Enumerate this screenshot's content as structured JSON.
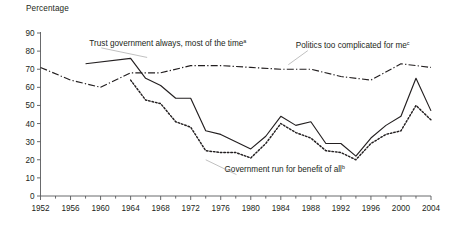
{
  "chart_data": {
    "type": "line",
    "title": "",
    "ylabel": "Percentage",
    "xlabel": "",
    "ylim": [
      0,
      90
    ],
    "xlim": [
      1952,
      2004
    ],
    "ytick_step": 10,
    "xtick_step": 4,
    "minor_xtick_step": 2,
    "grid": false,
    "legend": "inline-annotations",
    "yticks": [
      "0",
      "10",
      "20",
      "30",
      "40",
      "50",
      "60",
      "70",
      "80",
      "90"
    ],
    "xticks": [
      "1952",
      "1956",
      "1960",
      "1964",
      "1968",
      "1972",
      "1976",
      "1980",
      "1984",
      "1988",
      "1992",
      "1996",
      "2000",
      "2004"
    ],
    "annotations": [
      {
        "id": "trust-government-label",
        "text": "Trust government always, most of the time",
        "superscript": "a",
        "x": 1958.5,
        "y": 83,
        "anchor": "start",
        "leader_to": [
          1966.2,
          76.5
        ]
      },
      {
        "id": "politics-complicated-label",
        "text": "Politics too complicated for me",
        "superscript": "c",
        "x": 1986.0,
        "y": 81.5,
        "anchor": "start",
        "leader_to": [
          1985.0,
          72.5
        ]
      },
      {
        "id": "government-benefit-all-label",
        "text": "Government run for benefit of all",
        "superscript": "b",
        "x": 1976.5,
        "y": 13.0,
        "anchor": "start",
        "leader_to": [
          1974.0,
          20.0
        ]
      }
    ],
    "series": [
      {
        "name": "Trust government always, most of the time",
        "style": "solid",
        "color": "#231f20",
        "x": [
          1958,
          1964,
          1966,
          1968,
          1970,
          1972,
          1974,
          1976,
          1978,
          1980,
          1982,
          1984,
          1986,
          1988,
          1990,
          1992,
          1994,
          1996,
          1998,
          2000,
          2002,
          2004
        ],
        "values": [
          73,
          76,
          65,
          61,
          54,
          54,
          36,
          34,
          30,
          26,
          33,
          44,
          39,
          41,
          29,
          29,
          22,
          32,
          39,
          44,
          65,
          47
        ]
      },
      {
        "name": "Politics too complicated for me",
        "style": "dashdot",
        "color": "#231f20",
        "x": [
          1952,
          1956,
          1960,
          1964,
          1968,
          1972,
          1976,
          1980,
          1984,
          1988,
          1992,
          1996,
          2000,
          2004
        ],
        "values": [
          71,
          64,
          60,
          68,
          68,
          72,
          72,
          71,
          70,
          70,
          66,
          64,
          73,
          71
        ]
      },
      {
        "name": "Government run for benefit of all",
        "style": "dotted",
        "color": "#231f20",
        "x": [
          1964,
          1966,
          1968,
          1970,
          1972,
          1974,
          1976,
          1978,
          1980,
          1982,
          1984,
          1986,
          1988,
          1990,
          1992,
          1994,
          1996,
          1998,
          2000,
          2002,
          2004
        ],
        "values": [
          64,
          53,
          51,
          41,
          38,
          25,
          24,
          24,
          21,
          29,
          40,
          35,
          32,
          25,
          24,
          20,
          29,
          34,
          36,
          50,
          42
        ]
      }
    ]
  }
}
